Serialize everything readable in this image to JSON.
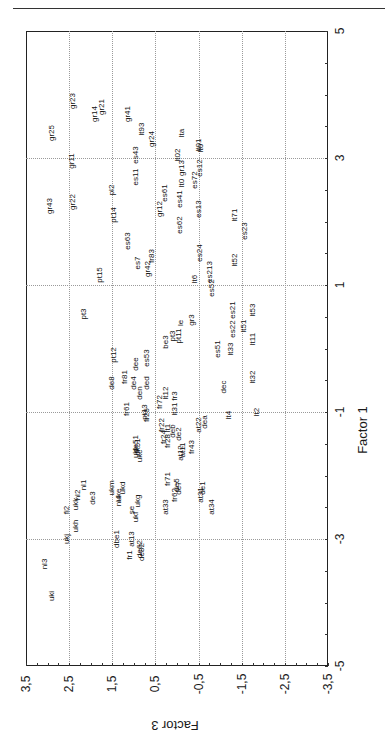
{
  "chart_data": {
    "type": "scatter",
    "title": "",
    "rotation": "plot rotated 90 degrees counter-clockwise on page",
    "xlabel": "Factor 1",
    "ylabel": "Factor 3",
    "xlim": [
      -5,
      5
    ],
    "ylim": [
      -3.5,
      3.5
    ],
    "x_ticks": [
      "5",
      "3",
      "1",
      "-1",
      "-3",
      "-5"
    ],
    "y_ticks": [
      "3,5",
      "2,5",
      "1,5",
      "0,5",
      "-0,5",
      "-1,5",
      "-2,5",
      "-3,5"
    ],
    "grid": true,
    "legend": null,
    "points": [
      {
        "label": "gr25",
        "f1": 3.4,
        "f3": 2.9
      },
      {
        "label": "gr23",
        "f1": 3.9,
        "f3": 2.4
      },
      {
        "label": "gr14",
        "f1": 3.7,
        "f3": 1.9
      },
      {
        "label": "gr21",
        "f1": 3.8,
        "f3": 1.75
      },
      {
        "label": "gr41",
        "f1": 3.7,
        "f3": 1.13
      },
      {
        "label": "lt93",
        "f1": 3.45,
        "f3": 0.8
      },
      {
        "label": "gr24",
        "f1": 3.3,
        "f3": 0.58
      },
      {
        "label": "gr11",
        "f1": 2.95,
        "f3": 2.43
      },
      {
        "label": "es43",
        "f1": 3.05,
        "f3": 0.95
      },
      {
        "label": "es11",
        "f1": 2.7,
        "f3": 0.95
      },
      {
        "label": "lta",
        "f1": 3.4,
        "f3": -0.12
      },
      {
        "label": "lt02",
        "f1": 3.05,
        "f3": -0.03
      },
      {
        "label": "lt01",
        "f1": 3.2,
        "f3": -0.5
      },
      {
        "label": "lt0",
        "f1": 3.15,
        "f3": -0.55
      },
      {
        "label": "gr13",
        "f1": 2.85,
        "f3": -0.12
      },
      {
        "label": "es12",
        "f1": 2.85,
        "f3": -0.54
      },
      {
        "label": "lt0",
        "f1": 2.6,
        "f3": -0.12
      },
      {
        "label": "es72",
        "f1": 2.65,
        "f3": -0.42
      },
      {
        "label": "pl2",
        "f1": 2.5,
        "f3": 1.5
      },
      {
        "label": "es61",
        "f1": 2.45,
        "f3": 0.27
      },
      {
        "label": "es41",
        "f1": 2.35,
        "f3": -0.07
      },
      {
        "label": "es13",
        "f1": 2.2,
        "f3": -0.5
      },
      {
        "label": "gr43",
        "f1": 2.25,
        "f3": 2.95
      },
      {
        "label": "gr22",
        "f1": 2.3,
        "f3": 2.4
      },
      {
        "label": "gr12",
        "f1": 2.2,
        "f3": 0.4
      },
      {
        "label": "pt14",
        "f1": 2.1,
        "f3": 1.45
      },
      {
        "label": "lt71",
        "f1": 2.1,
        "f3": -1.35
      },
      {
        "label": "es62",
        "f1": 1.95,
        "f3": -0.07
      },
      {
        "label": "es23",
        "f1": 1.85,
        "f3": -1.58
      },
      {
        "label": "es63",
        "f1": 1.7,
        "f3": 1.13
      },
      {
        "label": "fr83",
        "f1": 1.45,
        "f3": 0.58
      },
      {
        "label": "es7",
        "f1": 1.35,
        "f3": 0.9
      },
      {
        "label": "es24",
        "f1": 1.5,
        "f3": -0.54
      },
      {
        "label": "gr42",
        "f1": 1.25,
        "f3": 0.67
      },
      {
        "label": "lt52",
        "f1": 1.4,
        "f3": -1.35
      },
      {
        "label": "pt15",
        "f1": 1.15,
        "f3": 1.78
      },
      {
        "label": "lt6",
        "f1": 1.1,
        "f3": -0.42
      },
      {
        "label": "es213",
        "f1": 1.2,
        "f3": -0.77
      },
      {
        "label": "es52",
        "f1": 0.95,
        "f3": -0.81
      },
      {
        "label": "es21",
        "f1": 0.6,
        "f3": -1.3
      },
      {
        "label": "lt53",
        "f1": 0.6,
        "f3": -1.75
      },
      {
        "label": "pt3",
        "f1": 0.55,
        "f3": 2.15
      },
      {
        "label": "le",
        "f1": 0.4,
        "f3": -0.1
      },
      {
        "label": "gr3",
        "f1": 0.45,
        "f3": -0.35
      },
      {
        "label": "es22",
        "f1": 0.3,
        "f3": -1.3
      },
      {
        "label": "lt51",
        "f1": 0.35,
        "f3": -1.55
      },
      {
        "label": "pt3",
        "f1": 0.2,
        "f3": 0.1
      },
      {
        "label": "pt11",
        "f1": 0.2,
        "f3": -0.05
      },
      {
        "label": "be3",
        "f1": 0.1,
        "f3": 0.25
      },
      {
        "label": "lt11",
        "f1": 0.15,
        "f3": -1.75
      },
      {
        "label": "es51",
        "f1": 0.0,
        "f3": -0.95
      },
      {
        "label": "lt33",
        "f1": 0.0,
        "f3": -1.25
      },
      {
        "label": "pt12",
        "f1": -0.1,
        "f3": 1.45
      },
      {
        "label": "es53",
        "f1": -0.15,
        "f3": 0.7
      },
      {
        "label": "dee",
        "f1": -0.25,
        "f3": 0.95
      },
      {
        "label": "lt32",
        "f1": -0.45,
        "f3": -1.75
      },
      {
        "label": "fr81",
        "f1": -0.45,
        "f3": 1.2
      },
      {
        "label": "de8",
        "f1": -0.55,
        "f3": 1.5
      },
      {
        "label": "de4",
        "f1": -0.55,
        "f3": 1.0
      },
      {
        "label": "ded",
        "f1": -0.55,
        "f3": 0.7
      },
      {
        "label": "dec",
        "f1": -0.6,
        "f3": -1.1
      },
      {
        "label": "lt12",
        "f1": -0.7,
        "f3": 0.25
      },
      {
        "label": "fr3",
        "f1": -0.75,
        "f3": 0.05
      },
      {
        "label": "den",
        "f1": -0.7,
        "f3": 0.85
      },
      {
        "label": "fr72",
        "f1": -0.85,
        "f3": 0.4
      },
      {
        "label": "fr61",
        "f1": -0.95,
        "f3": 1.15
      },
      {
        "label": "pt13",
        "f1": -1.0,
        "f3": 0.75
      },
      {
        "label": "fr25",
        "f1": -1.05,
        "f3": 0.7
      },
      {
        "label": "lt31",
        "f1": -0.95,
        "f3": 0.05
      },
      {
        "label": "lt2",
        "f1": -1.0,
        "f3": -1.85
      },
      {
        "label": "lt4",
        "f1": -1.05,
        "f3": -1.2
      },
      {
        "label": "dea",
        "f1": -1.15,
        "f3": -0.65
      },
      {
        "label": "at22",
        "f1": -1.2,
        "f3": -0.5
      },
      {
        "label": "fr22",
        "f1": -1.2,
        "f3": 0.35
      },
      {
        "label": "lt1",
        "f1": -1.25,
        "f3": 0.2
      },
      {
        "label": "deb",
        "f1": -1.3,
        "f3": 0.1
      },
      {
        "label": "de2",
        "f1": -1.35,
        "f3": -0.05
      },
      {
        "label": "fr24",
        "f1": -1.4,
        "f3": 0.3
      },
      {
        "label": "fr28",
        "f1": -1.45,
        "f3": 0.2
      },
      {
        "label": "fr43",
        "f1": -1.55,
        "f3": -0.35
      },
      {
        "label": "at12",
        "f1": -1.65,
        "f3": -0.1
      },
      {
        "label": "at11",
        "f1": -1.6,
        "f3": -0.15
      },
      {
        "label": "de51",
        "f1": -1.5,
        "f3": 0.95
      },
      {
        "label": "dk51",
        "f1": -1.55,
        "f3": 0.9
      },
      {
        "label": "ukl",
        "f1": -1.65,
        "f3": 0.95
      },
      {
        "label": "ukc",
        "f1": -1.7,
        "f3": 0.85
      },
      {
        "label": "fr71",
        "f1": -2.05,
        "f3": 0.2
      },
      {
        "label": "de5",
        "f1": -2.15,
        "f3": 0.0
      },
      {
        "label": "de7",
        "f1": -2.2,
        "f3": -0.05
      },
      {
        "label": "fr62",
        "f1": -2.3,
        "f3": 0.05
      },
      {
        "label": "at31",
        "f1": -2.3,
        "f3": -0.55
      },
      {
        "label": "de1",
        "f1": -2.2,
        "f3": -0.6
      },
      {
        "label": "at34",
        "f1": -2.5,
        "f3": -0.8
      },
      {
        "label": "at33",
        "f1": -2.5,
        "f3": 0.25
      },
      {
        "label": "ukm",
        "f1": -2.2,
        "f3": 1.5
      },
      {
        "label": "ukd",
        "f1": -2.2,
        "f3": 1.25
      },
      {
        "label": "uke",
        "f1": -2.3,
        "f3": 1.35
      },
      {
        "label": "ukg",
        "f1": -2.4,
        "f3": 0.9
      },
      {
        "label": "nl1",
        "f1": -2.15,
        "f3": 2.15
      },
      {
        "label": "nl2",
        "f1": -2.3,
        "f3": 2.3
      },
      {
        "label": "de3",
        "f1": -2.35,
        "f3": 1.95
      },
      {
        "label": "nl4",
        "f1": -2.4,
        "f3": 1.35
      },
      {
        "label": "ukk",
        "f1": -2.45,
        "f3": 2.35
      },
      {
        "label": "se",
        "f1": -2.55,
        "f3": 1.05
      },
      {
        "label": "ukf",
        "f1": -2.65,
        "f3": 0.95
      },
      {
        "label": "fi2",
        "f1": -2.55,
        "f3": 2.55
      },
      {
        "label": "ukh",
        "f1": -2.8,
        "f3": 2.35
      },
      {
        "label": "ukj",
        "f1": -3.0,
        "f3": 2.55
      },
      {
        "label": "dbe1",
        "f1": -3.0,
        "f3": 1.4
      },
      {
        "label": "at13",
        "f1": -3.0,
        "f3": 1.05
      },
      {
        "label": "fr1",
        "f1": -3.25,
        "f3": 1.1
      },
      {
        "label": "de62",
        "f1": -3.15,
        "f3": 0.85
      },
      {
        "label": "de82",
        "f1": -3.2,
        "f3": 0.82
      },
      {
        "label": "nl3",
        "f1": -3.4,
        "f3": 3.05
      },
      {
        "label": "uki",
        "f1": -3.9,
        "f3": 2.9
      }
    ]
  },
  "axes": {
    "factor1": {
      "title": "Factor 1",
      "ticks": [
        {
          "label": "5",
          "value": 5
        },
        {
          "label": "3",
          "value": 3
        },
        {
          "label": "1",
          "value": 1
        },
        {
          "label": "-1",
          "value": -1
        },
        {
          "label": "-3",
          "value": -3
        },
        {
          "label": "-5",
          "value": -5
        }
      ]
    },
    "factor3": {
      "title": "Factor 3",
      "ticks": [
        {
          "label": "3,5",
          "value": 3.5
        },
        {
          "label": "2,5",
          "value": 2.5
        },
        {
          "label": "1,5",
          "value": 1.5
        },
        {
          "label": "0,5",
          "value": 0.5
        },
        {
          "label": "-0,5",
          "value": -0.5
        },
        {
          "label": "-1,5",
          "value": -1.5
        },
        {
          "label": "-2,5",
          "value": -2.5
        },
        {
          "label": "-3,5",
          "value": -3.5
        }
      ]
    }
  },
  "colors": {
    "ink": "#1a1a1a",
    "grid": "#9a9a9a",
    "background": "#ffffff"
  }
}
